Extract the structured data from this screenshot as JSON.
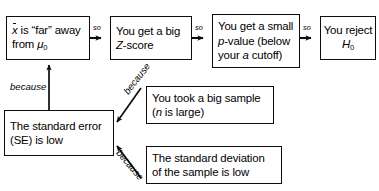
{
  "diagram": {
    "type": "flowchart",
    "ink_color": "#0d0d0d",
    "background": "#ffffff",
    "top_row": [
      {
        "id": "xbar-far",
        "lines": [
          "x̄ is “far” away",
          "from μ0"
        ],
        "line1_pre": "",
        "line1_bar": "x",
        "line1_post": " is “far” away",
        "line2_pre": "from ",
        "line2_sym": "μ",
        "line2_sub": "0"
      },
      {
        "id": "big-z",
        "line1": "You get a big",
        "line2_sym": "Z",
        "line2_post": "-score"
      },
      {
        "id": "small-p",
        "line1": "You get a small",
        "line2_sym": "p",
        "line2_post": "-value (below",
        "line3_pre": "your ",
        "line3_sym": "a",
        "line3_post": " cutoff)"
      },
      {
        "id": "reject-h0",
        "line1": "You reject",
        "line2_sym": "H",
        "line2_sub": "0"
      }
    ],
    "bottom": [
      {
        "id": "standard-error",
        "line1": "The standard error",
        "line2": "(SE) is low"
      },
      {
        "id": "big-sample",
        "line1": "You took a big sample",
        "line2_pre": "(",
        "line2_sym": "n",
        "line2_post": " is large)"
      },
      {
        "id": "low-sd",
        "line1": "The standard deviation",
        "line2": "of the sample is low"
      }
    ],
    "labels": {
      "so_1": "so",
      "so_2": "so",
      "so_3": "so",
      "because_vertical": "because",
      "because_sample": "because",
      "because_sd": "because"
    }
  }
}
